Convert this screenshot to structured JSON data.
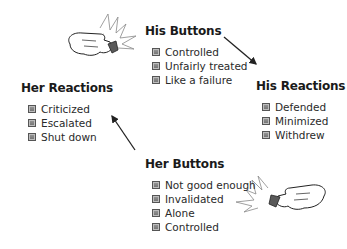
{
  "diagram": {
    "his_buttons": {
      "title": "His Buttons",
      "items": [
        "Controlled",
        "Unfairly treated",
        "Like a failure"
      ]
    },
    "his_reactions": {
      "title": "His Reactions",
      "items": [
        "Defended",
        "Minimized",
        "Withdrew"
      ]
    },
    "her_buttons": {
      "title": "Her Buttons",
      "items": [
        "Not good enough",
        "Invalidated",
        "Alone",
        "Controlled"
      ]
    },
    "her_reactions": {
      "title": "Her Reactions",
      "items": [
        "Criticized",
        "Escalated",
        "Shut down"
      ]
    },
    "icons": {
      "top_hand": "pointing-hand-pressing-button-icon",
      "bottom_hand": "pointing-hand-pressing-button-icon",
      "bullet": "square-bullet-icon"
    },
    "colors": {
      "text": "#222222",
      "bullet": "#7a7a7a",
      "arrow": "#222222"
    }
  }
}
